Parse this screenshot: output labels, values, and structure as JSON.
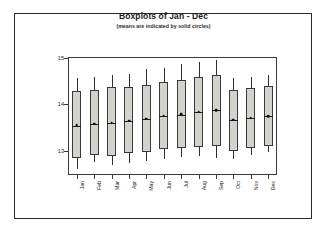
{
  "chart_data": {
    "type": "box",
    "title": "Boxplots of Jan - Dec",
    "subtitle": "(means are indicated by solid circles)",
    "xlabel": "",
    "ylabel": "",
    "ylim": [
      12.48,
      15.02
    ],
    "yticks": [
      15,
      14,
      13
    ],
    "ytick_labels": [
      "15",
      "14",
      "13"
    ],
    "grid": false,
    "legend": null,
    "categories": [
      "Jan",
      "Feb",
      "Mar",
      "Apr",
      "May",
      "Jun",
      "Jul",
      "Aug",
      "Sep",
      "Oct",
      "Nov",
      "Dec"
    ],
    "boxes": [
      {
        "label": "Jan",
        "whisker_low": 12.6,
        "q1": 12.85,
        "median": 13.53,
        "q3": 14.28,
        "whisker_high": 14.56,
        "mean": 13.55
      },
      {
        "label": "Feb",
        "whisker_low": 12.75,
        "q1": 12.9,
        "median": 13.57,
        "q3": 14.32,
        "whisker_high": 14.6,
        "mean": 13.58
      },
      {
        "label": "Mar",
        "whisker_low": 12.7,
        "q1": 12.88,
        "median": 13.6,
        "q3": 14.37,
        "whisker_high": 14.64,
        "mean": 13.61
      },
      {
        "label": "Apr",
        "whisker_low": 12.74,
        "q1": 12.95,
        "median": 13.64,
        "q3": 14.38,
        "whisker_high": 14.66,
        "mean": 13.65
      },
      {
        "label": "May",
        "whisker_low": 12.78,
        "q1": 12.98,
        "median": 13.68,
        "q3": 14.42,
        "whisker_high": 14.76,
        "mean": 13.69
      },
      {
        "label": "Jun",
        "whisker_low": 12.82,
        "q1": 13.03,
        "median": 13.75,
        "q3": 14.48,
        "whisker_high": 14.79,
        "mean": 13.76
      },
      {
        "label": "Jul",
        "whisker_low": 12.86,
        "q1": 13.06,
        "median": 13.78,
        "q3": 14.52,
        "whisker_high": 14.86,
        "mean": 13.79
      },
      {
        "label": "Aug",
        "whisker_low": 12.88,
        "q1": 13.08,
        "median": 13.83,
        "q3": 14.58,
        "whisker_high": 14.92,
        "mean": 13.84
      },
      {
        "label": "Sep",
        "whisker_low": 12.84,
        "q1": 13.1,
        "median": 13.87,
        "q3": 14.64,
        "whisker_high": 14.96,
        "mean": 13.88
      },
      {
        "label": "Oct",
        "whisker_low": 12.83,
        "q1": 12.99,
        "median": 13.66,
        "q3": 14.3,
        "whisker_high": 14.56,
        "mean": 13.67
      },
      {
        "label": "Nov",
        "whisker_low": 12.92,
        "q1": 13.06,
        "median": 13.7,
        "q3": 14.36,
        "whisker_high": 14.6,
        "mean": 13.71
      },
      {
        "label": "Dec",
        "whisker_low": 12.98,
        "q1": 13.1,
        "median": 13.74,
        "q3": 14.4,
        "whisker_high": 14.64,
        "mean": 13.75
      }
    ]
  }
}
